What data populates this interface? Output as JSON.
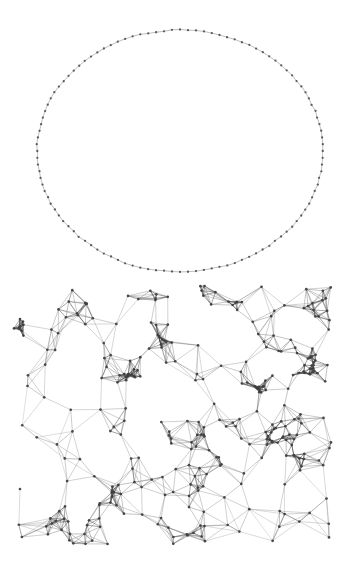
{
  "figure": {
    "title": "",
    "background_color": "#ffffff",
    "width": 353,
    "height": 570,
    "node_color": "#4a4a4a",
    "edge_color": "#6e6e6e",
    "edge_color_dark": "#3a3a3a",
    "node_radius": 1.25,
    "edge_width": 0.45
  },
  "panels": [
    {
      "id": "circular-layout-graph",
      "name": "Circular layout graph",
      "type": "ring",
      "description": "Nodes evenly placed on an ellipse, each joined to its immediate neighbours forming a closed ring.",
      "layout": {
        "center_x": 180,
        "center_y": 151,
        "radius_x": 143,
        "radius_y": 121,
        "node_count": 112,
        "start_angle_deg": 0,
        "radial_jitter": 0.6,
        "seed": 20731
      },
      "bounds": {
        "x": 37,
        "y": 30,
        "width": 286,
        "height": 242
      },
      "style": {
        "node_radius": 1.15,
        "edge_width": 0.5,
        "node_color": "#555555",
        "edge_color": "#777777",
        "edge_opacity": 0.95
      }
    },
    {
      "id": "spatial-mesh-graph",
      "name": "Spatial mesh graph",
      "type": "mesh",
      "description": "Dense geometric / proximity graph with clustered vertices and triangulated edges.",
      "layout": {
        "node_count": 330,
        "bounds_x": 14,
        "bounds_y": 286,
        "bounds_width": 318,
        "bounds_height": 258,
        "neighbor_links": 5,
        "link_radius": 40,
        "cluster_count": 26,
        "cluster_tightness": 0.62,
        "seed": 91117
      },
      "bounds": {
        "x": 14,
        "y": 286,
        "width": 318,
        "height": 258
      },
      "style": {
        "node_radius": 1.35,
        "edge_width": 0.42,
        "node_color": "#3f3f3f",
        "edge_color": "#6a6a6a",
        "edge_opacity": 0.88
      }
    }
  ],
  "chart_data": {
    "type": "scatter",
    "title": "",
    "xlabel": "",
    "ylabel": "",
    "grid": false,
    "legend": null,
    "annotations": [],
    "series": [
      {
        "name": "circular-ring-nodes",
        "marker": "dot",
        "color": "#555555",
        "point_count": 112,
        "edge_count": 112
      },
      {
        "name": "mesh-nodes",
        "marker": "dot",
        "color": "#3f3f3f",
        "point_count": 330,
        "edge_count": 1240
      }
    ]
  }
}
